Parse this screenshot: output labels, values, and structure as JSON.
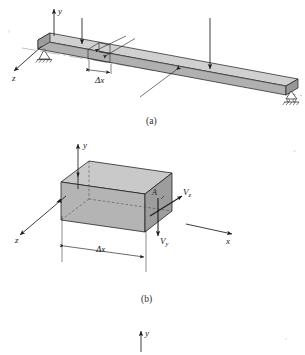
{
  "figure": {
    "title_caption_a": "(a)",
    "title_caption_b": "(b)",
    "background_color": "#ffffff",
    "ink_color": "#1a1a1a",
    "beam_face_color": "#b3b3b3",
    "beam_top_color": "#cccccc",
    "beam_end_color": "#9a9a9a"
  },
  "panel_a": {
    "caption": "(a)",
    "axes": [
      {
        "name": "y-axis",
        "label": "y",
        "direction": "up"
      },
      {
        "name": "z-axis",
        "label": "z",
        "direction": "down-left"
      }
    ],
    "dimension": {
      "label": "Δx",
      "name": "delta-x-dimension"
    },
    "supports": [
      {
        "name": "pin-support",
        "type": "pin",
        "position": "left-end"
      },
      {
        "name": "roller-support",
        "type": "roller",
        "position": "right-end"
      }
    ],
    "loads": [
      {
        "name": "point-load-left",
        "direction": "down"
      },
      {
        "name": "point-load-right",
        "direction": "down"
      }
    ],
    "leaders": [
      {
        "name": "slice-leader-upper"
      },
      {
        "name": "slice-leader-lower"
      },
      {
        "name": "beam-leader"
      }
    ]
  },
  "panel_b": {
    "caption": "(b)",
    "axes": [
      {
        "name": "y-axis",
        "label": "y",
        "direction": "up"
      },
      {
        "name": "z-axis",
        "label": "z",
        "direction": "down-left"
      },
      {
        "name": "x-axis",
        "label": "x",
        "direction": "right"
      }
    ],
    "dimension": {
      "label": "Δx",
      "name": "delta-x-dimension"
    },
    "forces": [
      {
        "name": "shear-force-vz",
        "label": "V",
        "subscript": "z",
        "direction": "up-right"
      },
      {
        "name": "shear-force-vy",
        "label": "V",
        "subscript": "y",
        "direction": "down"
      }
    ],
    "annotations": [
      {
        "name": "area-label",
        "label": "A"
      }
    ]
  },
  "panel_c": {
    "axes": [
      {
        "name": "y-axis",
        "label": "y",
        "direction": "up"
      }
    ]
  }
}
